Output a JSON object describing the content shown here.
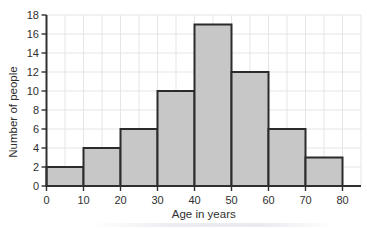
{
  "chart_data": {
    "type": "bar",
    "subtype": "histogram",
    "xlabel": "Age in years",
    "ylabel": "Number of people",
    "bin_width": 10,
    "bin_starts": [
      0,
      10,
      20,
      30,
      40,
      50,
      60,
      70
    ],
    "categories": [
      "0-10",
      "10-20",
      "20-30",
      "30-40",
      "40-50",
      "50-60",
      "60-70",
      "70-80"
    ],
    "values": [
      2,
      4,
      6,
      10,
      17,
      12,
      6,
      3
    ],
    "xlim": [
      0,
      85
    ],
    "ylim": [
      0,
      18
    ],
    "x_ticks": [
      0,
      10,
      20,
      30,
      40,
      50,
      60,
      70,
      80
    ],
    "y_ticks": [
      0,
      2,
      4,
      6,
      8,
      10,
      12,
      14,
      16,
      18
    ],
    "grid": true,
    "x_grid_step": 5,
    "y_grid_step": 2,
    "legend": "none",
    "colors": {
      "bar_fill": "#c7c7c7",
      "bar_border": "#2b2b2b",
      "grid_line": "#e4e5e7",
      "axis_line": "#2f2f2f",
      "text": "#2f2f2f"
    }
  }
}
